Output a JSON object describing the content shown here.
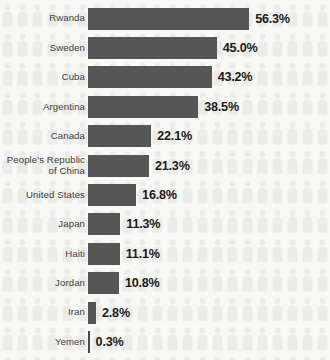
{
  "chart_data": {
    "type": "bar",
    "orientation": "horizontal",
    "title": "",
    "xlabel": "",
    "ylabel": "",
    "xlim": [
      0,
      60
    ],
    "grid": false,
    "legend": null,
    "value_suffix": "%",
    "categories": [
      "Rwanda",
      "Sweden",
      "Cuba",
      "Argentina",
      "Canada",
      "People's Republic\nof China",
      "United States",
      "Japan",
      "Haiti",
      "Jordan",
      "Iran",
      "Yemen"
    ],
    "values": [
      56.3,
      45.0,
      43.2,
      38.5,
      22.1,
      21.3,
      16.8,
      11.3,
      11.1,
      10.8,
      2.8,
      0.3
    ],
    "value_labels": [
      "56.3%",
      "45.0%",
      "43.2%",
      "38.5%",
      "22.1%",
      "21.3%",
      "16.8%",
      "11.3%",
      "11.1%",
      "10.8%",
      "2.8%",
      "0.3%"
    ]
  },
  "style": {
    "bar_color": "#565656",
    "background_color": "#f8f8f6",
    "label_color": "#3c3c3c",
    "value_color": "#1b1b1b",
    "watermark_icon": "person-icon"
  },
  "rows": [
    {
      "label": "Rwanda",
      "value": 56.3,
      "value_label": "56.3%"
    },
    {
      "label": "Sweden",
      "value": 45.0,
      "value_label": "45.0%"
    },
    {
      "label": "Cuba",
      "value": 43.2,
      "value_label": "43.2%"
    },
    {
      "label": "Argentina",
      "value": 38.5,
      "value_label": "38.5%"
    },
    {
      "label": "Canada",
      "value": 22.1,
      "value_label": "22.1%"
    },
    {
      "label": "People's Republic\nof China",
      "value": 21.3,
      "value_label": "21.3%"
    },
    {
      "label": "United States",
      "value": 16.8,
      "value_label": "16.8%"
    },
    {
      "label": "Japan",
      "value": 11.3,
      "value_label": "11.3%"
    },
    {
      "label": "Haiti",
      "value": 11.1,
      "value_label": "11.1%"
    },
    {
      "label": "Jordan",
      "value": 10.8,
      "value_label": "10.8%"
    },
    {
      "label": "Iran",
      "value": 2.8,
      "value_label": "2.8%"
    },
    {
      "label": "Yemen",
      "value": 0.3,
      "value_label": "0.3%"
    }
  ]
}
